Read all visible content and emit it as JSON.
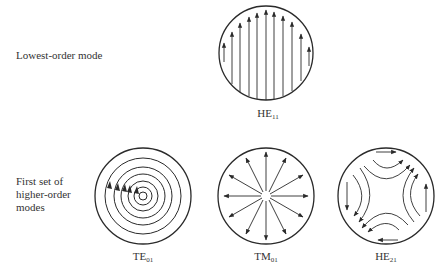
{
  "figure": {
    "row_labels": {
      "lowest": "Lowest-order mode",
      "higher": [
        "First set of",
        "higher-order",
        "modes"
      ]
    },
    "modes": [
      {
        "id": "he11",
        "base": "HE",
        "sub": "11",
        "pattern": "parallel-vertical-arrows"
      },
      {
        "id": "te01",
        "base": "TE",
        "sub": "01",
        "pattern": "concentric-circles"
      },
      {
        "id": "tm01",
        "base": "TM",
        "sub": "01",
        "pattern": "radial-arrows"
      },
      {
        "id": "he21",
        "base": "HE",
        "sub": "21",
        "pattern": "hyperbolic-field-lines"
      }
    ],
    "colors": {
      "line": "#2a2a2a",
      "background": "#ffffff"
    }
  }
}
